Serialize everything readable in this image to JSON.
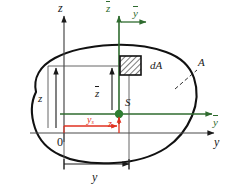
{
  "figure": {
    "name": "cross-section-centroid-diagram",
    "colors": {
      "outline": "#111111",
      "global_axis": "#4a4a4a",
      "centroidal_axis": "#2f6b2f",
      "centroid_marker": "#2f7d32",
      "dimension_red": "#e03020",
      "background": "#ffffff"
    }
  },
  "labels": {
    "axis_z_global": "z",
    "axis_y_global": "y",
    "axis_z_centroidal": "z",
    "axis_y_centroidal_top": "y",
    "axis_y_centroidal_right": "y",
    "origin": "0",
    "centroid": "S",
    "area_element": "dA",
    "area": "A",
    "dim_z_global": "z",
    "dim_z_centroidal": "z",
    "dim_y_global": "y",
    "dim_y_centroid": "y",
    "dim_y_centroid_sub": "s",
    "dim_z_centroid": "z",
    "dim_z_centroid_sub": "s"
  },
  "geometry": {
    "origin_px": {
      "x": 64,
      "y": 133
    },
    "centroid_px": {
      "x": 119,
      "y": 114
    },
    "element_px": {
      "x": 129,
      "y": 66
    },
    "z_global_axis_top_px": {
      "x": 64,
      "y": 14
    },
    "y_global_axis_right_px": {
      "x": 215,
      "y": 133
    },
    "z_centroidal_axis_top_px": {
      "x": 119,
      "y": 14
    },
    "y_centroidal_axis_right_px": {
      "x": 213,
      "y": 114
    }
  }
}
